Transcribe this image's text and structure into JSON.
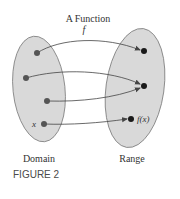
{
  "figure": {
    "title": "A Function",
    "function_symbol": "f",
    "domain_label": "Domain",
    "range_label": "Range",
    "caption": "FIGURE 2",
    "input_label": "x",
    "output_label": "f(x)"
  },
  "colors": {
    "ellipse_fill": "#d9d9d9",
    "ellipse_stroke": "#7a7a7a",
    "domain_dot": "#555555",
    "range_dot": "#1a1a1a",
    "arrow": "#444444"
  },
  "domain_points": [
    {
      "x": 37,
      "y": 53
    },
    {
      "x": 26,
      "y": 78
    },
    {
      "x": 47,
      "y": 101
    },
    {
      "x": 44,
      "y": 124,
      "label": "x"
    }
  ],
  "range_points": [
    {
      "x": 144,
      "y": 51
    },
    {
      "x": 144,
      "y": 86
    },
    {
      "x": 131,
      "y": 119,
      "label": "f(x)"
    }
  ],
  "mappings": [
    {
      "from": 0,
      "to": 0
    },
    {
      "from": 1,
      "to": 1
    },
    {
      "from": 2,
      "to": 1
    },
    {
      "from": 3,
      "to": 2
    }
  ]
}
